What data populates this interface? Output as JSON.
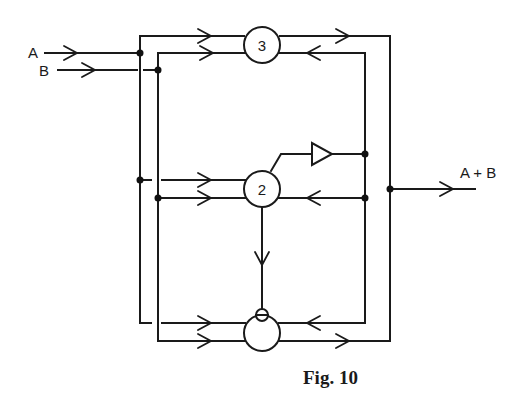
{
  "figure": {
    "caption": "Fig. 10",
    "inputs": [
      {
        "id": "A",
        "label": "A"
      },
      {
        "id": "B",
        "label": "B"
      }
    ],
    "output": {
      "label": "A + B"
    },
    "components": [
      {
        "id": "c3",
        "label": "3",
        "type": "circle"
      },
      {
        "id": "c2",
        "label": "2",
        "type": "circle"
      },
      {
        "id": "c0",
        "label": "",
        "type": "circle-with-inhibit"
      },
      {
        "id": "amp",
        "label": "",
        "type": "triangle-amplifier"
      }
    ],
    "colors": {
      "line": "#1a1a1a",
      "background": "#ffffff"
    }
  }
}
